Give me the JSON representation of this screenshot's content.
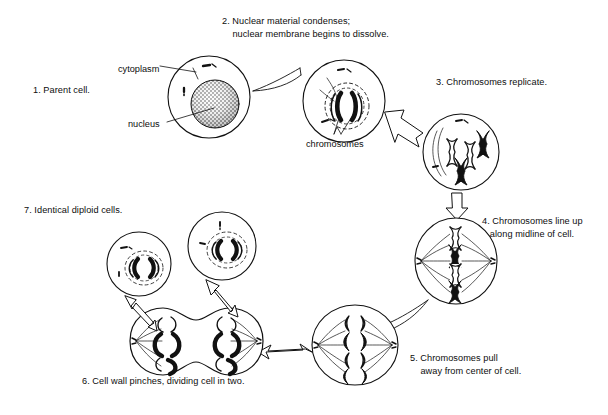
{
  "figure": {
    "background_color": "#ffffff",
    "ink_color": "#111111"
  },
  "steps": [
    {
      "id": 1,
      "label": "1. Parent cell.",
      "x": 33,
      "y": 84,
      "align": "left"
    },
    {
      "id": 2,
      "label": "2. Nuclear material condenses;\n    nuclear membrane begins to dissolve.",
      "x": 222,
      "y": 15,
      "align": "left"
    },
    {
      "id": 3,
      "label": "3. Chromosomes replicate.",
      "x": 436,
      "y": 76,
      "align": "left"
    },
    {
      "id": 4,
      "label": "4. Chromosomes line up\n   along midline of cell.",
      "x": 482,
      "y": 215,
      "align": "left"
    },
    {
      "id": 5,
      "label": "5. Chromosomes pull\n    away from center of cell.",
      "x": 410,
      "y": 352,
      "align": "left"
    },
    {
      "id": 6,
      "label": "6. Cell wall pinches, dividing cell in two.",
      "x": 82,
      "y": 375,
      "align": "left"
    },
    {
      "id": 7,
      "label": "7. Identical diploid cells.",
      "x": 24,
      "y": 204,
      "align": "left"
    }
  ],
  "part_labels": [
    {
      "id": "cytoplasm",
      "text": "cytoplasm",
      "x": 118,
      "y": 63
    },
    {
      "id": "nucleus",
      "text": "nucleus",
      "x": 128,
      "y": 118
    },
    {
      "id": "chromosomes",
      "text": "chromosomes",
      "x": 306,
      "y": 138
    }
  ],
  "cells": [
    {
      "id": "parent-cell",
      "step": 1,
      "shape": "circle",
      "cx": 209,
      "cy": 97,
      "r": 41,
      "contents": "stippled round nucleus, two small dark rod organelles in cytoplasm"
    },
    {
      "id": "prophase-cell",
      "step": 2,
      "shape": "circle",
      "cx": 344,
      "cy": 101,
      "r": 41,
      "contents": "condensed chromosomes inside dissolving dashed nuclear membrane"
    },
    {
      "id": "replicated-cell",
      "step": 3,
      "shape": "circle",
      "cx": 461,
      "cy": 152,
      "r": 38,
      "contents": "four X-shaped replicated chromosomes, two black and two outlined"
    },
    {
      "id": "metaphase-cell",
      "step": 4,
      "shape": "ellipse",
      "cx": 456,
      "cy": 261,
      "rx": 41,
      "ry": 43,
      "contents": "chromosomes lined along vertical midline with spindle fibers"
    },
    {
      "id": "anaphase-cell",
      "step": 5,
      "shape": "ellipse",
      "cx": 355,
      "cy": 345,
      "rx": 43,
      "ry": 40,
      "contents": "chromosome halves pulled toward opposite poles"
    },
    {
      "id": "telophase-cell",
      "step": 6,
      "shape": "dumbbell",
      "cx": 196,
      "cy": 341,
      "contents": "pinched peanut-shaped cell with chromosome clusters at each end"
    },
    {
      "id": "daughter-cell-left",
      "step": 7,
      "shape": "circle",
      "cx": 139,
      "cy": 264,
      "r": 32,
      "contents": "identical diploid cell with reformed nucleus"
    },
    {
      "id": "daughter-cell-right",
      "step": 7,
      "shape": "circle",
      "cx": 222,
      "cy": 246,
      "r": 34,
      "contents": "identical diploid cell with reformed nucleus"
    }
  ],
  "arrows": [
    {
      "id": "arrow-1-to-2",
      "from": "parent-cell",
      "to": "prophase-cell",
      "style": "tapered-curve"
    },
    {
      "id": "arrow-2-to-3",
      "from": "prophase-cell",
      "to": "replicated-cell",
      "style": "hollow-block"
    },
    {
      "id": "arrow-3-to-4",
      "from": "replicated-cell",
      "to": "metaphase-cell",
      "style": "hollow-block-down"
    },
    {
      "id": "arrow-4-to-5",
      "from": "metaphase-cell",
      "to": "anaphase-cell",
      "style": "tapered-curve"
    },
    {
      "id": "arrow-5-to-6",
      "from": "anaphase-cell",
      "to": "telophase-cell",
      "style": "hollow-block-left"
    },
    {
      "id": "arrow-6-to-7-left",
      "from": "telophase-cell",
      "to": "daughter-cell-left",
      "style": "hollow-block-up-left"
    },
    {
      "id": "arrow-6-to-7-right",
      "from": "telophase-cell",
      "to": "daughter-cell-right",
      "style": "hollow-block-up-right"
    }
  ],
  "leader_lines": [
    {
      "id": "leader-cytoplasm",
      "from_label": "cytoplasm",
      "to_cell": "parent-cell"
    },
    {
      "id": "leader-nucleus",
      "from_label": "nucleus",
      "to_cell": "parent-cell"
    },
    {
      "id": "leader-chromosomes",
      "from_label": "chromosomes",
      "to_cell": "prophase-cell"
    }
  ]
}
